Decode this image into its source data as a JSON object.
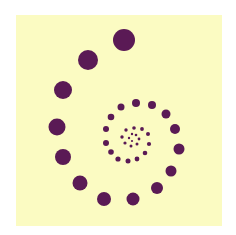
{
  "colors": {
    "background": "#ffffff",
    "panel": "#fbfbc2",
    "dot": "#5a1a55"
  },
  "panel": {
    "x": 16,
    "y": 15,
    "width": 206,
    "height": 211
  },
  "dots": [
    {
      "x": 124,
      "y": 40,
      "r": 11
    },
    {
      "x": 88,
      "y": 60,
      "r": 10
    },
    {
      "x": 63,
      "y": 90,
      "r": 9
    },
    {
      "x": 57,
      "y": 127,
      "r": 8.5
    },
    {
      "x": 63,
      "y": 157,
      "r": 8
    },
    {
      "x": 80,
      "y": 183,
      "r": 7.5
    },
    {
      "x": 104,
      "y": 199,
      "r": 7
    },
    {
      "x": 133,
      "y": 199,
      "r": 6.5
    },
    {
      "x": 157,
      "y": 188,
      "r": 6
    },
    {
      "x": 171,
      "y": 171,
      "r": 5.5
    },
    {
      "x": 179,
      "y": 149,
      "r": 5.5
    },
    {
      "x": 175,
      "y": 129,
      "r": 5
    },
    {
      "x": 166,
      "y": 114,
      "r": 4.5
    },
    {
      "x": 152,
      "y": 105,
      "r": 4
    },
    {
      "x": 136,
      "y": 103,
      "r": 4
    },
    {
      "x": 121,
      "y": 107,
      "r": 3.5
    },
    {
      "x": 111,
      "y": 117,
      "r": 3.3
    },
    {
      "x": 106,
      "y": 129,
      "r": 3
    },
    {
      "x": 106,
      "y": 143,
      "r": 3
    },
    {
      "x": 111,
      "y": 152,
      "r": 2.8
    },
    {
      "x": 118,
      "y": 159,
      "r": 2.6
    },
    {
      "x": 128,
      "y": 161,
      "r": 2.5
    },
    {
      "x": 137,
      "y": 159,
      "r": 2.4
    },
    {
      "x": 145,
      "y": 153,
      "r": 2.3
    },
    {
      "x": 149,
      "y": 144,
      "r": 2.1
    },
    {
      "x": 148,
      "y": 134,
      "r": 2
    },
    {
      "x": 142,
      "y": 129,
      "r": 1.9
    },
    {
      "x": 134,
      "y": 128,
      "r": 1.8
    },
    {
      "x": 126,
      "y": 130,
      "r": 1.7
    },
    {
      "x": 122,
      "y": 137,
      "r": 1.7
    },
    {
      "x": 125,
      "y": 143,
      "r": 1.6
    },
    {
      "x": 131,
      "y": 146,
      "r": 1.5
    },
    {
      "x": 137,
      "y": 144,
      "r": 1.5
    },
    {
      "x": 139,
      "y": 139,
      "r": 1.4
    },
    {
      "x": 136,
      "y": 135,
      "r": 1.3
    },
    {
      "x": 132,
      "y": 134,
      "r": 1.2
    },
    {
      "x": 129,
      "y": 138,
      "r": 1.2
    },
    {
      "x": 132,
      "y": 141,
      "r": 1.1
    }
  ]
}
